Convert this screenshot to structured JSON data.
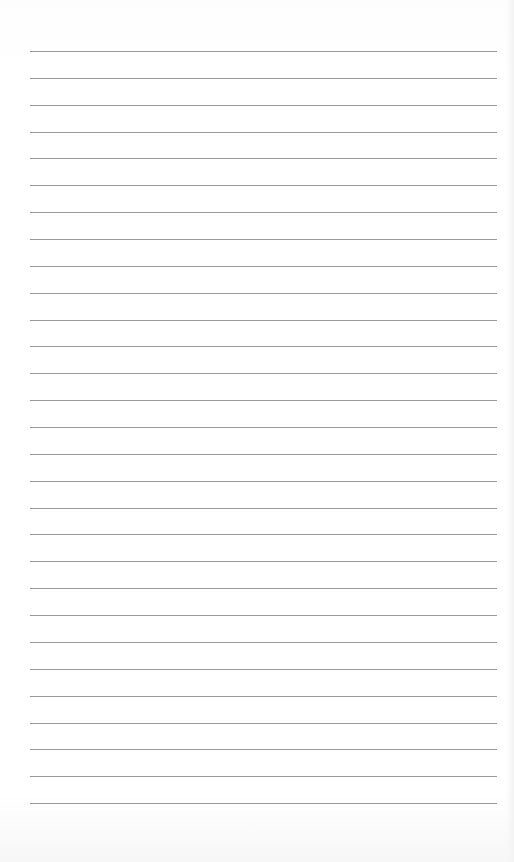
{
  "page": {
    "type": "blank lined paper",
    "line_count": 29,
    "first_line_y": 51,
    "line_spacing": 26.86,
    "line_left": 30,
    "line_width": 467,
    "line_color": "#9a9a9a",
    "background_color": "#ffffff"
  }
}
